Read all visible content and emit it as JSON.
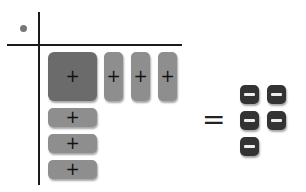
{
  "diagram": {
    "type": "algebra-tiles-factoring",
    "axes": {
      "vertical": true,
      "horizontal": true
    },
    "corner_marker": "dot",
    "top_factor_tiles": [
      {
        "kind": "x-squared",
        "sign": "+"
      },
      {
        "kind": "x",
        "sign": "+"
      },
      {
        "kind": "x",
        "sign": "+"
      },
      {
        "kind": "x",
        "sign": "+"
      }
    ],
    "left_factor_tiles": [
      {
        "kind": "x",
        "sign": "+"
      },
      {
        "kind": "x",
        "sign": "+"
      },
      {
        "kind": "x",
        "sign": "+"
      }
    ],
    "equals": "=",
    "result_tiles": [
      {
        "kind": "unit",
        "sign": "−"
      },
      {
        "kind": "unit",
        "sign": "−"
      },
      {
        "kind": "unit",
        "sign": "−"
      },
      {
        "kind": "unit",
        "sign": "−"
      },
      {
        "kind": "unit",
        "sign": "−"
      }
    ],
    "colors": {
      "x_squared_tile": "#6b6b6b",
      "x_tile": "#8e8e8e",
      "negative_unit_tile": "#333333",
      "axis": "#1a1a1a"
    }
  }
}
